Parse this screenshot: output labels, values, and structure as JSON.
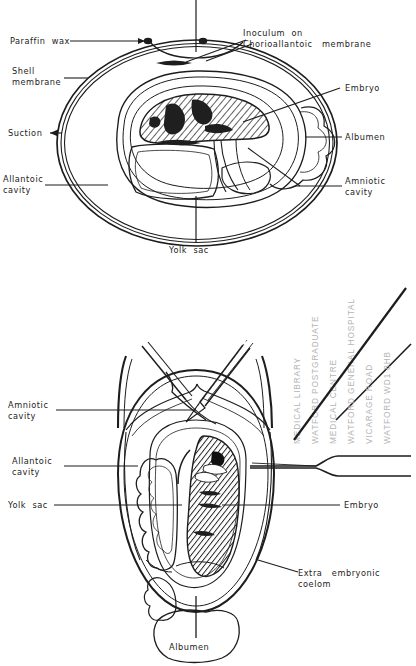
{
  "figure": {
    "type": "biological-diagram",
    "panels": [
      {
        "name": "upper-panel",
        "view": "longitudinal section of incubated hen egg, horizontal",
        "labels": [
          {
            "key": "paraffin-wax",
            "text": "Paraffin  wax"
          },
          {
            "key": "shell-membrane",
            "text": "Shell\nmembrane"
          },
          {
            "key": "suction",
            "text": "Suction"
          },
          {
            "key": "allantoic-cavity",
            "text": "Allantoic\ncavity"
          },
          {
            "key": "yolk-sac",
            "text": "Yolk  sac"
          },
          {
            "key": "inoculum-on-cam",
            "text": "Inoculum  on\nChorioallantoic   membrane"
          },
          {
            "key": "embryo",
            "text": "Embryo"
          },
          {
            "key": "albumen",
            "text": "Albumen"
          },
          {
            "key": "amniotic-cavity",
            "text": "Amniotic\ncavity"
          }
        ],
        "suction_arrow": "←"
      },
      {
        "name": "lower-panel",
        "view": "egg opened at the blunt end, forceps and pipette inserted",
        "labels": [
          {
            "key": "amniotic-cavity",
            "text": "Amniotic\ncavity"
          },
          {
            "key": "allantoic-cavity",
            "text": "Allantoic\ncavity"
          },
          {
            "key": "yolk-sac",
            "text": "Yolk  sac"
          },
          {
            "key": "embryo",
            "text": "Embryo"
          },
          {
            "key": "extra-embryonic-coelom",
            "text": "Extra   embryonic\ncoelom"
          },
          {
            "key": "albumen",
            "text": "Albumen"
          }
        ]
      }
    ]
  },
  "library_stamp": {
    "lines": [
      "MEDICAL LIBRARY",
      "WATFORD POSTGRADUATE",
      "MEDICAL CENTRE",
      "WATFORD GENERAL HOSPITAL",
      "VICARAGE ROAD",
      "WATFORD WD1 8HB"
    ]
  },
  "colors": {
    "ink": "#1d1d1d",
    "embryo_fill": "#8d8d8d",
    "yolk_fill": "#ececec",
    "albumen_fill": "#ffffff",
    "stamp_ink": "#b4b4b4",
    "paper": "#ffffff"
  }
}
